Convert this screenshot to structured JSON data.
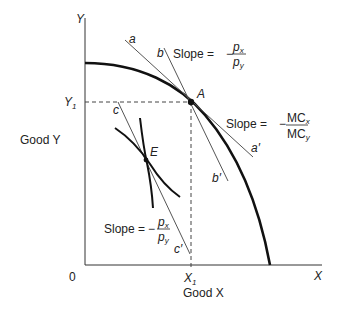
{
  "diagram": {
    "type": "production-possibility-frontier",
    "axes": {
      "y_axis_label": "Y",
      "x_axis_label": "X",
      "origin_label": "0",
      "y_title": "Good Y",
      "x_title": "Good X",
      "y1_label": "Y",
      "y1_sub": "1",
      "x1_label": "X",
      "x1_sub": "1"
    },
    "points": {
      "A": "A",
      "E": "E"
    },
    "lines": {
      "a": "a",
      "a_prime": "a′",
      "b": "b",
      "b_prime": "b′",
      "c": "c",
      "c_prime": "c′"
    },
    "annotations": {
      "slope_top": {
        "text": "Slope =",
        "minus": "−",
        "numerator": "p",
        "numerator_sub": "x",
        "denominator": "p",
        "denominator_sub": "y"
      },
      "slope_right": {
        "text": "Slope =",
        "minus": "−",
        "numerator": "MC",
        "numerator_sub": "x",
        "denominator": "MC",
        "denominator_sub": "y"
      },
      "slope_bottom": {
        "text": "Slope =",
        "minus": "−",
        "numerator": "p",
        "numerator_sub": "x",
        "denominator": "p",
        "denominator_sub": "y"
      }
    },
    "colors": {
      "ink": "#1a1a1a",
      "thin_line": "#555555",
      "background": "#ffffff"
    }
  }
}
